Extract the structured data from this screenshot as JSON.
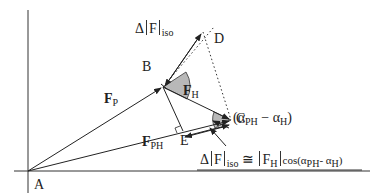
{
  "diagram": {
    "points": {
      "A": {
        "label": "A",
        "x": 28,
        "y": 171
      },
      "B": {
        "label": "B",
        "x": 163,
        "y": 87
      },
      "C": {
        "label": "C",
        "x": 231,
        "y": 120
      },
      "D": {
        "label": "D",
        "x": 210,
        "y": 33
      },
      "E": {
        "label": "E",
        "x": 183,
        "y": 131
      }
    },
    "vectors": {
      "FP": {
        "symbol": "F",
        "sub": "P"
      },
      "FH": {
        "symbol": "F",
        "sub": "H"
      },
      "FPH": {
        "symbol": "F",
        "sub": "PH"
      }
    },
    "annotations": {
      "delta_top": {
        "delta": "Δ",
        "F": "F",
        "sub": "iso"
      },
      "angle": {
        "open": "(α",
        "sub1": "PH",
        "minus": " − α",
        "sub2": "H",
        "close": ")"
      },
      "formula": {
        "delta": "Δ",
        "F": "F",
        "sub_iso": "iso",
        "approx": " ≅ ",
        "FH": "F",
        "sub_H": "H",
        "cos": "cos(α",
        "sub_PH": "PH",
        "minus": "- α",
        "sub_H2": "H",
        "close": ")"
      }
    },
    "colors": {
      "line": "#222222",
      "arc_fill": "#b8b8b8",
      "axis": "#333333"
    }
  }
}
